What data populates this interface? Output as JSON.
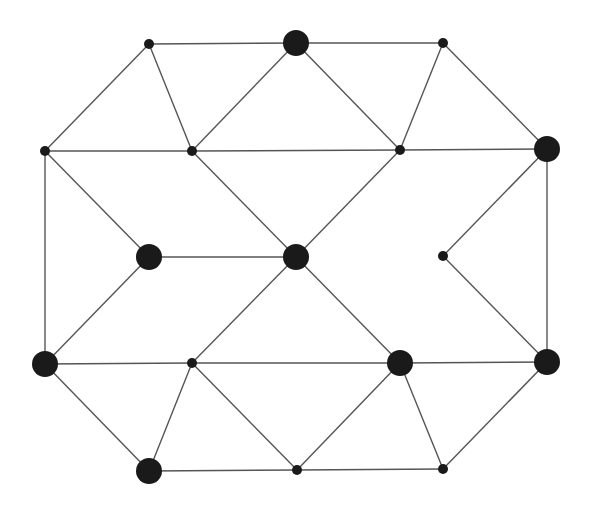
{
  "diagram": {
    "type": "graph",
    "colors": {
      "background": "#ffffff",
      "edge": "#555555",
      "node": "#1a1a1a"
    },
    "nodes": [
      {
        "id": "A",
        "x": 149,
        "y": 44,
        "r": 5
      },
      {
        "id": "B",
        "x": 296,
        "y": 43,
        "r": 13
      },
      {
        "id": "C",
        "x": 443,
        "y": 43,
        "r": 5
      },
      {
        "id": "D",
        "x": 45,
        "y": 151,
        "r": 5
      },
      {
        "id": "E",
        "x": 192,
        "y": 151,
        "r": 5
      },
      {
        "id": "F",
        "x": 400,
        "y": 150,
        "r": 5
      },
      {
        "id": "G",
        "x": 547,
        "y": 149,
        "r": 13
      },
      {
        "id": "H",
        "x": 149,
        "y": 257,
        "r": 13
      },
      {
        "id": "I",
        "x": 296,
        "y": 257,
        "r": 13
      },
      {
        "id": "J",
        "x": 443,
        "y": 256,
        "r": 5
      },
      {
        "id": "K",
        "x": 45,
        "y": 364,
        "r": 13
      },
      {
        "id": "L",
        "x": 192,
        "y": 363,
        "r": 5
      },
      {
        "id": "M",
        "x": 400,
        "y": 363,
        "r": 13
      },
      {
        "id": "N",
        "x": 547,
        "y": 362,
        "r": 13
      },
      {
        "id": "O",
        "x": 149,
        "y": 471,
        "r": 13
      },
      {
        "id": "P",
        "x": 297,
        "y": 470,
        "r": 5
      },
      {
        "id": "Q",
        "x": 443,
        "y": 469,
        "r": 5
      }
    ],
    "edges": [
      [
        "A",
        "B"
      ],
      [
        "B",
        "C"
      ],
      [
        "A",
        "D"
      ],
      [
        "A",
        "E"
      ],
      [
        "B",
        "E"
      ],
      [
        "B",
        "F"
      ],
      [
        "C",
        "F"
      ],
      [
        "C",
        "G"
      ],
      [
        "D",
        "E"
      ],
      [
        "E",
        "F"
      ],
      [
        "F",
        "G"
      ],
      [
        "D",
        "H"
      ],
      [
        "D",
        "K"
      ],
      [
        "E",
        "I"
      ],
      [
        "H",
        "I"
      ],
      [
        "I",
        "F"
      ],
      [
        "G",
        "J"
      ],
      [
        "G",
        "N"
      ],
      [
        "H",
        "K"
      ],
      [
        "I",
        "L"
      ],
      [
        "I",
        "M"
      ],
      [
        "J",
        "N"
      ],
      [
        "K",
        "L"
      ],
      [
        "L",
        "M"
      ],
      [
        "M",
        "N"
      ],
      [
        "K",
        "O"
      ],
      [
        "L",
        "O"
      ],
      [
        "L",
        "P"
      ],
      [
        "O",
        "P"
      ],
      [
        "M",
        "P"
      ],
      [
        "M",
        "Q"
      ],
      [
        "P",
        "Q"
      ],
      [
        "N",
        "Q"
      ]
    ]
  }
}
